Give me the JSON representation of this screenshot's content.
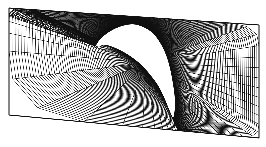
{
  "figure": {
    "width": 266,
    "height": 147,
    "background_color": "#ffffff",
    "line_color": "#111111",
    "line_width": 0.45,
    "body_fill_color": "#ffffff",
    "border_color": "#111111",
    "border_width": 1.0
  },
  "chart_data": {
    "type": "line",
    "title": "",
    "subtitle": "",
    "xlabel": "",
    "ylabel": "",
    "grid": true,
    "legend": false,
    "legend_position": "none",
    "xlim": [
      0,
      266
    ],
    "ylim": [
      0,
      147
    ],
    "mesh": {
      "kind": "structured-c-grid",
      "radial_lines": 120,
      "circumferential_lines": 96,
      "radial_clustering_exponent": 2.35,
      "note": "lines drawn from body surface outward to sheared outer boundary"
    },
    "outer_boundary": {
      "label": "far-field-boundary",
      "closed": true,
      "points": [
        [
          9,
          8
        ],
        [
          259,
          25
        ],
        [
          259,
          138
        ],
        [
          9,
          115
        ]
      ]
    },
    "body_surface": {
      "label": "airfoil-surface",
      "closed": true,
      "comment": "hook / comma shaped body, leading-edge hook at left, sharp trailing tail at lower right",
      "points": [
        [
          96,
          45
        ],
        [
          101,
          38
        ],
        [
          110,
          31
        ],
        [
          121,
          26
        ],
        [
          133,
          24
        ],
        [
          144,
          27
        ],
        [
          153,
          33
        ],
        [
          160,
          42
        ],
        [
          166,
          54
        ],
        [
          170,
          67
        ],
        [
          173,
          82
        ],
        [
          175,
          97
        ],
        [
          175,
          110
        ],
        [
          173,
          118
        ],
        [
          169,
          110
        ],
        [
          164,
          98
        ],
        [
          158,
          86
        ],
        [
          150,
          75
        ],
        [
          141,
          65
        ],
        [
          131,
          57
        ],
        [
          121,
          51
        ],
        [
          112,
          47
        ],
        [
          104,
          45
        ],
        [
          99,
          47
        ]
      ]
    },
    "wake_cut": {
      "label": "wake-cut-line",
      "from": [
        173,
        118
      ],
      "to": [
        259,
        95
      ]
    },
    "shear": {
      "top_left_y": 8,
      "top_right_y": 25,
      "bottom_left_y": 115,
      "bottom_right_y": 138,
      "left_x": 9,
      "right_x": 259
    }
  }
}
